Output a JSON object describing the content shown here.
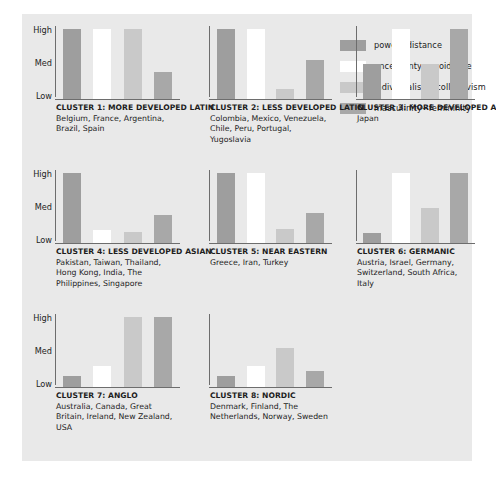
{
  "legend": {
    "items": [
      {
        "label": "power−distance",
        "color": "#9e9e9e"
      },
      {
        "label": "uncertainty−avoidance",
        "color": "#ffffff"
      },
      {
        "label": "individualism−collectivism",
        "color": "#c9c9c9"
      },
      {
        "label": "masculinity−femininity",
        "color": "#a8a8a8"
      }
    ]
  },
  "axis": {
    "ticks": [
      "High",
      "Med",
      "Low"
    ]
  },
  "chart_data": {
    "type": "bar",
    "title": "",
    "xlabel": "",
    "ylabel": "",
    "ylim": [
      0,
      100
    ],
    "ytick_labels": [
      "Low",
      "Med",
      "High"
    ],
    "ytick_values": [
      0,
      50,
      100
    ],
    "grid": false,
    "legend_position": "top-right",
    "series": [
      {
        "name": "power−distance",
        "color": "#9e9e9e"
      },
      {
        "name": "uncertainty−avoidance",
        "color": "#ffffff"
      },
      {
        "name": "individualism−collectivism",
        "color": "#c9c9c9"
      },
      {
        "name": "masculinity−femininity",
        "color": "#a8a8a8"
      }
    ],
    "panels": [
      {
        "title": "CLUSTER 1: MORE DEVELOPED LATIN",
        "members": "Belgium, France, Argentina, Brazil, Spain",
        "categories": [
          "power−distance",
          "uncertainty−avoidance",
          "individualism−collectivism",
          "masculinity−femininity"
        ],
        "values": [
          100,
          100,
          100,
          38
        ]
      },
      {
        "title": "CLUSTER 2: LESS DEVELOPED LATIN",
        "members": "Colombia, Mexico, Venezuela, Chile, Peru, Portugal, Yugoslavia",
        "categories": [
          "power−distance",
          "uncertainty−avoidance",
          "individualism−collectivism",
          "masculinity−femininity"
        ],
        "values": [
          100,
          100,
          14,
          56
        ]
      },
      {
        "title": "CLUSTER 3: MORE DEVELOPED ASIAN",
        "members": "Japan",
        "categories": [
          "power−distance",
          "uncertainty−avoidance",
          "individualism−collectivism",
          "masculinity−femininity"
        ],
        "values": [
          50,
          100,
          50,
          100
        ]
      },
      {
        "title": "CLUSTER 4: LESS DEVELOPED ASIAN",
        "members": "Pakistan, Taiwan, Thailand, Hong Kong, India, The Philippines, Singapore",
        "categories": [
          "power−distance",
          "uncertainty−avoidance",
          "individualism−collectivism",
          "masculinity−femininity"
        ],
        "values": [
          100,
          18,
          16,
          40
        ]
      },
      {
        "title": "CLUSTER 5: NEAR EASTERN",
        "members": "Greece, Iran, Turkey",
        "categories": [
          "power−distance",
          "uncertainty−avoidance",
          "individualism−collectivism",
          "masculinity−femininity"
        ],
        "values": [
          100,
          100,
          20,
          42
        ]
      },
      {
        "title": "CLUSTER 6: GERMANIC",
        "members": "Austria, Israel, Germany, Switzerland, South Africa, Italy",
        "categories": [
          "power−distance",
          "uncertainty−avoidance",
          "individualism−collectivism",
          "masculinity−femininity"
        ],
        "values": [
          14,
          100,
          50,
          100
        ]
      },
      {
        "title": "CLUSTER 7: ANGLO",
        "members": "Australia, Canada, Great Britain, Ireland, New Zealand, USA",
        "categories": [
          "power−distance",
          "uncertainty−avoidance",
          "individualism−collectivism",
          "masculinity−femininity"
        ],
        "values": [
          16,
          30,
          100,
          100
        ]
      },
      {
        "title": "CLUSTER 8: NORDIC",
        "members": "Denmark, Finland, The Netherlands, Norway, Sweden",
        "categories": [
          "power−distance",
          "uncertainty−avoidance",
          "individualism−collectivism",
          "masculinity−femininity"
        ],
        "values": [
          16,
          30,
          56,
          22
        ]
      }
    ]
  },
  "colors": {
    "panel_background": "#e9e9e9",
    "page_background": "#ffffff",
    "axis": "#6d6d6d",
    "text": "#1d1d1d"
  }
}
